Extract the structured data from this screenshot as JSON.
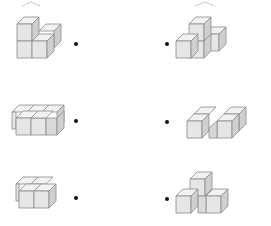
{
  "exercise": {
    "type": "matching",
    "instruction_visible": false
  },
  "colors": {
    "cube_front": "#e6e6e6",
    "cube_top": "#f2f2f2",
    "cube_side": "#cfcfcf",
    "cube_edge": "#8a8a8a",
    "dot": "#111111",
    "background": "#ffffff"
  },
  "left_column": [
    {
      "id": "L1",
      "description": "L-shaped stack: 2 cubes tall at back-left, 1 cube front-right, 1 cube behind",
      "cube_count": 4
    },
    {
      "id": "L2",
      "description": "Flat row of cubes with one offset behind (T/L tromino-like footprint)",
      "cube_count": 4
    },
    {
      "id": "L3",
      "description": "2x2 flat block of cubes",
      "cube_count": 4
    }
  ],
  "right_column": [
    {
      "id": "R1",
      "description": "Row of 3 cubes with one stacked on top of the middle",
      "cube_count": 4
    },
    {
      "id": "R2",
      "description": "Zigzag (S/Z) flat arrangement of 4 cubes",
      "cube_count": 4
    },
    {
      "id": "R3",
      "description": "Pyramid: 2 cubes at bottom, 1 cube on top",
      "cube_count": 3
    }
  ],
  "connector_dots": {
    "left": [
      "•",
      "•",
      "•"
    ],
    "right": [
      "•",
      "•",
      "•"
    ]
  }
}
